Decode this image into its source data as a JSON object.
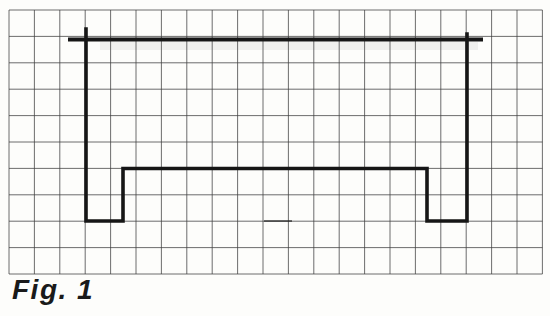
{
  "figure": {
    "caption": "Fig. 1",
    "grid": {
      "origin_x": 9,
      "origin_y": 10,
      "cols": 21,
      "rows": 10,
      "cell_w": 25.4,
      "cell_h": 26.4,
      "line_color": "#424242",
      "line_width": 0.9,
      "line_opacity": 0.85
    },
    "outline": {
      "color": "#161616",
      "stroke_width": 3.6,
      "top_stroke_width": 4.2,
      "top_line": [
        [
          68,
          39.5
        ],
        [
          483,
          39.5
        ]
      ],
      "body": [
        [
          86,
          29
        ],
        [
          86,
          221
        ],
        [
          123,
          221
        ],
        [
          123,
          168.5
        ],
        [
          427,
          168.5
        ],
        [
          427,
          221
        ],
        [
          467,
          221
        ],
        [
          467,
          34
        ]
      ]
    },
    "artifacts": {
      "smudge": {
        "x": 100,
        "y": 42,
        "width": 378,
        "height": 8,
        "color": "rgba(70,70,70,0.07)"
      },
      "dash": {
        "points": [
          [
            264,
            221
          ],
          [
            292,
            221
          ]
        ],
        "color": "rgba(30,30,30,0.6)",
        "stroke_width": 2
      }
    }
  }
}
